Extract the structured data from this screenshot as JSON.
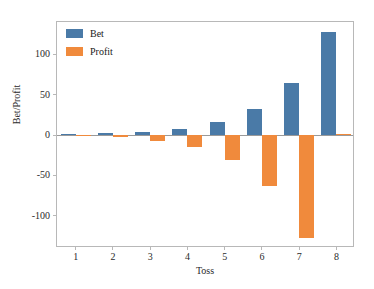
{
  "chart_data": {
    "type": "bar",
    "title": "",
    "xlabel": "Toss",
    "ylabel": "Bet/Profit",
    "categories": [
      "1",
      "2",
      "3",
      "4",
      "5",
      "6",
      "7",
      "8"
    ],
    "series": [
      {
        "name": "Bet",
        "color": "#4a7aa7",
        "values": [
          1,
          2,
          4,
          8,
          16,
          32,
          64,
          128
        ]
      },
      {
        "name": "Profit",
        "color": "#f08a3c",
        "values": [
          -1,
          -3,
          -7,
          -15,
          -31,
          -63,
          -127,
          1
        ]
      }
    ],
    "ylim": [
      -140,
      140
    ],
    "yticks": [
      100,
      50,
      0,
      -50,
      -100
    ],
    "ytick_labels": [
      "100",
      "50",
      "0",
      "-50",
      "-100"
    ],
    "xticks": [
      1,
      2,
      3,
      4,
      5,
      6,
      7,
      8
    ],
    "grid": false,
    "legend_position": "upper left",
    "zero_line": 0
  }
}
